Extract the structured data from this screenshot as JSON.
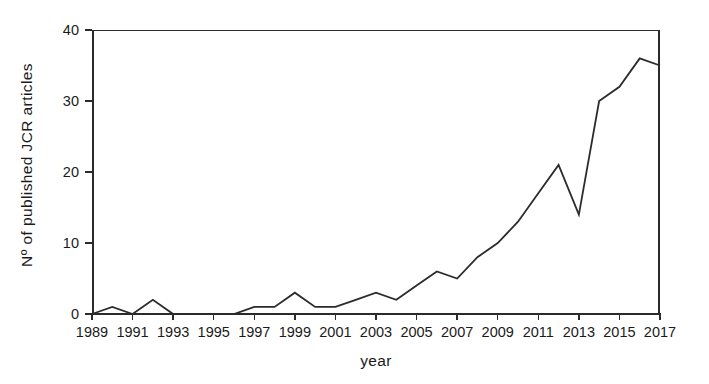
{
  "chart_data": {
    "type": "line",
    "title": "",
    "xlabel": "year",
    "ylabel": "Nº of published JCR articles",
    "xlim": [
      1989,
      2017
    ],
    "ylim": [
      0,
      40
    ],
    "grid": false,
    "legend": "none",
    "x_tick_labels": [
      "1989",
      "1991",
      "1993",
      "1995",
      "1997",
      "1999",
      "2001",
      "2003",
      "2005",
      "2007",
      "2009",
      "2011",
      "2013",
      "2015",
      "2017"
    ],
    "y_tick_labels": [
      "0",
      "10",
      "20",
      "30",
      "40"
    ],
    "y_ticks": [
      0,
      10,
      20,
      30,
      40
    ],
    "x": [
      1989,
      1990,
      1991,
      1992,
      1993,
      1994,
      1995,
      1996,
      1997,
      1998,
      1999,
      2000,
      2001,
      2002,
      2003,
      2004,
      2005,
      2006,
      2007,
      2008,
      2009,
      2010,
      2011,
      2012,
      2013,
      2014,
      2015,
      2016,
      2017
    ],
    "values": [
      0,
      1,
      0,
      2,
      0,
      0,
      0,
      0,
      1,
      1,
      3,
      1,
      1,
      2,
      3,
      2,
      4,
      6,
      5,
      8,
      10,
      13,
      17,
      21,
      14,
      30,
      32,
      36,
      35
    ],
    "series": [
      {
        "name": "Nº of published JCR articles",
        "color": "#2b2b2b",
        "values": [
          0,
          1,
          0,
          2,
          0,
          0,
          0,
          0,
          1,
          1,
          3,
          1,
          1,
          2,
          3,
          2,
          4,
          6,
          5,
          8,
          10,
          13,
          17,
          21,
          14,
          30,
          32,
          36,
          35
        ]
      }
    ]
  },
  "figure": {
    "axis_color": "#2b2b2b",
    "line_color": "#2b2b2b",
    "background": "#ffffff"
  }
}
